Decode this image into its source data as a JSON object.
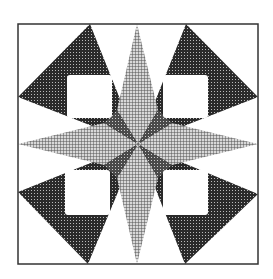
{
  "figure": {
    "colors": {
      "background": "#ffffff",
      "border": "#333333",
      "light_hatch_bg": "#d8d8d8",
      "light_hatch_line": "#555555",
      "dark_hatch_bg": "#2a2a2a",
      "dark_hatch_dot": "#bbbbbb",
      "mid_hatch_bg": "#4a4a4a",
      "window": "#ffffff"
    },
    "border": {
      "x": 18,
      "y": 24,
      "w": 240,
      "h": 240
    },
    "center": {
      "x": 138,
      "y": 144
    }
  }
}
